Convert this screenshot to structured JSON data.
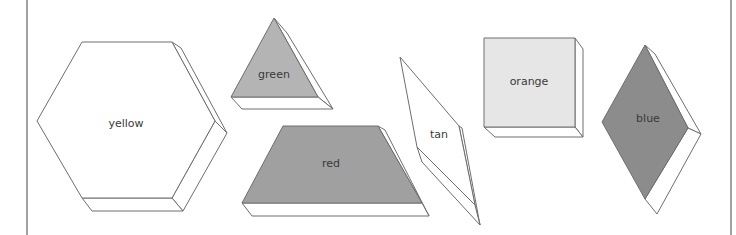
{
  "diagram": {
    "frame": {
      "left_x": 27,
      "right_x": 731
    },
    "blocks": [
      {
        "id": "hexagon",
        "shape": "hexagon",
        "label": "yellow",
        "fill": "#ffffff",
        "front": "82,42 172,42 215,121 172,198 82,198 37,121",
        "sides": [
          "172,42 181,48 227,133 215,121",
          "215,121 227,133 183,211 172,198",
          "172,198 183,211 92,211 82,198"
        ],
        "label_pos": {
          "x": 126,
          "y": 124
        }
      },
      {
        "id": "triangle",
        "shape": "triangle",
        "label": "green",
        "fill": "#b4b4b4",
        "front": "274,18 318,97 231,97",
        "sides": [
          "274,18 287,33 333,109 318,97",
          "318,97 333,109 242,109 231,97"
        ],
        "label_pos": {
          "x": 274,
          "y": 75
        }
      },
      {
        "id": "trapezoid",
        "shape": "trapezoid",
        "label": "red",
        "fill": "#a0a0a0",
        "front": "283,126 378,126 422,203 242,203",
        "sides": [
          "378,126 385,130 429,216 422,203",
          "422,203 429,216 252,216 242,203"
        ],
        "label_pos": {
          "x": 331,
          "y": 164
        }
      },
      {
        "id": "thin-rhombus",
        "shape": "rhombus",
        "label": "tan",
        "fill": "#ffffff",
        "front": "400,57 459,126 475,205 417,147",
        "sides": [
          "459,126 462,128 480,225 475,205",
          "417,147 475,205 480,225 422,162"
        ],
        "label_pos": {
          "x": 439,
          "y": 135
        }
      },
      {
        "id": "square",
        "shape": "square",
        "label": "orange",
        "fill": "#e6e6e6",
        "front": "484,38 575,38 575,127 484,127",
        "sides": [
          "575,38 583,49 583,137 575,127",
          "575,127 583,137 495,137 484,127"
        ],
        "label_pos": {
          "x": 529,
          "y": 82
        }
      },
      {
        "id": "rhombus",
        "shape": "rhombus",
        "label": "blue",
        "fill": "#8c8c8c",
        "front": "645,45 688,128 645,199 602,122",
        "sides": [
          "645,45 655,54 701,134 688,128",
          "688,128 701,134 657,214 645,199"
        ],
        "label_pos": {
          "x": 648,
          "y": 119
        }
      }
    ]
  }
}
